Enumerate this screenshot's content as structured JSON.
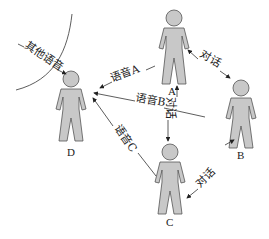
{
  "diagram": {
    "people": [
      {
        "id": "A",
        "label": "A"
      },
      {
        "id": "B",
        "label": "B"
      },
      {
        "id": "C",
        "label": "C"
      },
      {
        "id": "D",
        "label": "D"
      }
    ],
    "arrows": {
      "other_speech": "其他语音",
      "speech_a": "语音A",
      "speech_b": "语音B",
      "speech_c": "语音C",
      "dialog_ab": "对话",
      "dialog_ac": "对话",
      "dialog_bc": "对话"
    }
  }
}
